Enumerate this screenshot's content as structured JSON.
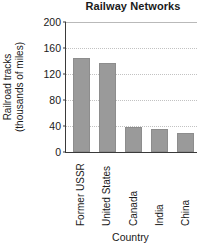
{
  "chart_data": {
    "type": "bar",
    "title": "Railway Networks",
    "xlabel": "Country",
    "ylabel_line1": "Railroad tracks",
    "ylabel_line2": "(thousands of miles)",
    "categories": [
      "Former USSR",
      "United States",
      "Canada",
      "India",
      "China"
    ],
    "values": [
      145,
      137,
      39,
      36,
      29
    ],
    "ylim": [
      0,
      200
    ],
    "yticks": [
      0,
      40,
      80,
      120,
      160,
      200
    ],
    "ytick_labels": [
      "0",
      "40",
      "80",
      "120",
      "160",
      "200"
    ],
    "grid": true,
    "legend": "none",
    "bar_color": "#9a9a9a",
    "axis_color": "#3a3a3a",
    "grid_color": "#c2c2c2"
  }
}
